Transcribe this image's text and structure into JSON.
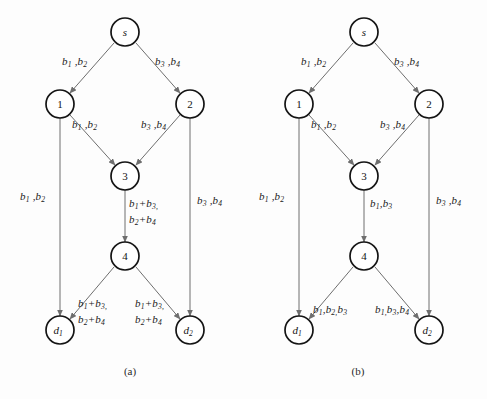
{
  "figure": {
    "panels": [
      {
        "id": "a",
        "caption": "(a)",
        "nodes": [
          {
            "id": "s",
            "label": "s",
            "style": "italic"
          },
          {
            "id": "n1",
            "label": "1",
            "style": "plain"
          },
          {
            "id": "n2",
            "label": "2",
            "style": "plain"
          },
          {
            "id": "n3",
            "label": "3",
            "style": "plain"
          },
          {
            "id": "n4",
            "label": "4",
            "style": "plain"
          },
          {
            "id": "d1",
            "label": "d",
            "sub": "1",
            "style": "italic"
          },
          {
            "id": "d2",
            "label": "d",
            "sub": "2",
            "style": "italic"
          }
        ],
        "edges": [
          {
            "id": "s-n1",
            "from": "s",
            "to": "n1",
            "label": "b<sub>1</sub> ,b<sub>2</sub>"
          },
          {
            "id": "s-n2",
            "from": "s",
            "to": "n2",
            "label": "b<sub>3</sub> ,b<sub>4</sub>"
          },
          {
            "id": "n1-n3",
            "from": "n1",
            "to": "n3",
            "label": "b<sub>1</sub> ,b<sub>2</sub>"
          },
          {
            "id": "n2-n3",
            "from": "n2",
            "to": "n3",
            "label": "b<sub>3</sub> ,b<sub>4</sub>"
          },
          {
            "id": "n1-d1",
            "from": "n1",
            "to": "d1",
            "label": "b<sub>1</sub> ,b<sub>2</sub>"
          },
          {
            "id": "n2-d2",
            "from": "n2",
            "to": "d2",
            "label": "b<sub>3</sub> ,b<sub>4</sub>"
          },
          {
            "id": "n3-n4",
            "from": "n3",
            "to": "n4",
            "label": "b<sub>1</sub>+b<sub>3,</sub><br>b<sub>2</sub>+b<sub>4</sub>"
          },
          {
            "id": "n4-d1",
            "from": "n4",
            "to": "d1",
            "label": "b<sub>1</sub>+b<sub>3,</sub><br>b<sub>2</sub>+b<sub>4</sub>"
          },
          {
            "id": "n4-d2",
            "from": "n4",
            "to": "d2",
            "label": "b<sub>1</sub>+b<sub>3,</sub><br>b<sub>2</sub>+b<sub>4</sub>"
          }
        ]
      },
      {
        "id": "b",
        "caption": "(b)",
        "nodes": [
          {
            "id": "s",
            "label": "s",
            "style": "italic"
          },
          {
            "id": "n1",
            "label": "1",
            "style": "plain"
          },
          {
            "id": "n2",
            "label": "2",
            "style": "plain"
          },
          {
            "id": "n3",
            "label": "3",
            "style": "plain"
          },
          {
            "id": "n4",
            "label": "4",
            "style": "plain"
          },
          {
            "id": "d1",
            "label": "d",
            "sub": "1",
            "style": "italic"
          },
          {
            "id": "d2",
            "label": "d",
            "sub": "2",
            "style": "italic"
          }
        ],
        "edges": [
          {
            "id": "s-n1",
            "from": "s",
            "to": "n1",
            "label": "b<sub>1</sub> ,b<sub>2</sub>"
          },
          {
            "id": "s-n2",
            "from": "s",
            "to": "n2",
            "label": "b<sub>3</sub> ,b<sub>4</sub>"
          },
          {
            "id": "n1-n3",
            "from": "n1",
            "to": "n3",
            "label": "b<sub>1</sub> ,b<sub>2</sub>"
          },
          {
            "id": "n2-n3",
            "from": "n2",
            "to": "n3",
            "label": "b<sub>3</sub> ,b<sub>4</sub>"
          },
          {
            "id": "n1-d1",
            "from": "n1",
            "to": "d1",
            "label": "b<sub>1</sub> ,b<sub>2</sub>"
          },
          {
            "id": "n2-d2",
            "from": "n2",
            "to": "d2",
            "label": "b<sub>3</sub> ,b<sub>4</sub>"
          },
          {
            "id": "n3-n4",
            "from": "n3",
            "to": "n4",
            "label": "b<sub>1</sub>,b<sub>3</sub>"
          },
          {
            "id": "n4-d1",
            "from": "n4",
            "to": "d1",
            "label": "b<sub>1</sub>,b<sub>2,</sub>b<sub>3</sub>"
          },
          {
            "id": "n4-d2",
            "from": "n4",
            "to": "d2",
            "label": "b<sub>1,</sub>b<sub>3</sub>,b<sub>4</sub>"
          }
        ]
      }
    ],
    "colors": {
      "node_stroke": "#141414",
      "edge_stroke": "#6e6e6e",
      "text": "#1a1a1a",
      "background": "#fdfdfd"
    }
  }
}
